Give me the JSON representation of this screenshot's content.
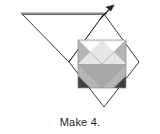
{
  "figure": {
    "kind": "quilt-block-folding-diagram",
    "caption": "Make 4.",
    "colors": {
      "outline": "#231f20",
      "fold_line": "#8c8c8c",
      "background": "#ffffff",
      "patch_medium": "#b5b5b5",
      "patch_medium_dark": "#a8a8a8",
      "patch_light": "#e6e6e6",
      "patch_dark": "#3f3f3f",
      "patch_white": "#ffffff",
      "caption_text": "#231f20"
    },
    "outer_diamond": {
      "label": "outer-diamond",
      "points": "104,14 139,62 104,107 69,62"
    },
    "fold_triangle": {
      "label": "fold-back-triangle",
      "points": "22,14 104,14 69,62"
    },
    "fold_top_line": {
      "label": "fold-top-edge",
      "x1": 22,
      "y1": 14,
      "x2": 106,
      "y2": 14
    },
    "inner_square": {
      "label": "inner-pieced-square",
      "x": 78,
      "y": 40,
      "width": 48,
      "height": 48
    },
    "patches": [
      {
        "name": "patch-left-medium",
        "points": "78,40 102,64 78,88"
      },
      {
        "name": "patch-right-medium",
        "points": "126,40 126,88 102,64"
      },
      {
        "name": "patch-center-chevron",
        "points": "78,64 102,88 126,64 126,88 78,88"
      },
      {
        "name": "patch-top-light-diamond",
        "points": "102,40 126,64 102,88 78,64"
      },
      {
        "name": "patch-corner-dark-left",
        "points": "78,76 90,88 78,88"
      },
      {
        "name": "patch-corner-dark-right",
        "points": "126,76 126,88 114,88"
      }
    ],
    "arrow": {
      "name": "fold-direction-arrow",
      "shaft": {
        "x1": 100,
        "y1": 19,
        "x2": 114,
        "y2": 5
      },
      "head": "114,5 106,7 111,11"
    }
  }
}
